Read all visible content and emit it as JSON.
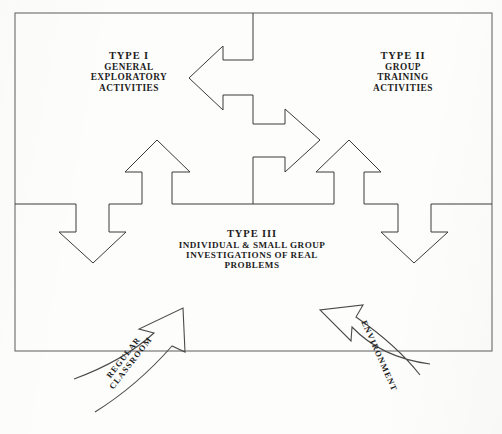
{
  "diagram": {
    "background_color": "#fdfdfc",
    "ink_color": "#3a3a3a",
    "frame_color": "#6b6b6b",
    "frame": {
      "name": "outer-rectangle",
      "x": 15,
      "y": 13,
      "width": 477,
      "height": 338
    },
    "blocks": [
      {
        "id": "type1",
        "heading": "TYPE I",
        "lines": [
          "GENERAL",
          "EXPLORATORY",
          "ACTIVITIES"
        ]
      },
      {
        "id": "type2",
        "heading": "TYPE II",
        "lines": [
          "GROUP",
          "TRAINING",
          "ACTIVITIES"
        ]
      },
      {
        "id": "type3",
        "heading": "TYPE III",
        "lines": [
          "INDIVIDUAL & SMALL GROUP",
          "INVESTIGATIONS OF REAL",
          "PROBLEMS"
        ]
      }
    ],
    "arrows": [
      {
        "id": "center-double-arrow",
        "icon": "double-headed-z-arrow",
        "points_to": [
          "type1",
          "type2"
        ],
        "description": "Z-shaped double-headed arrow linking Type I and Type II"
      },
      {
        "id": "up-arrow-left",
        "icon": "arrow-up-icon",
        "description": "Up arrow from Type III region toward Type I"
      },
      {
        "id": "up-arrow-right",
        "icon": "arrow-up-icon",
        "description": "Up arrow from Type III region toward Type II"
      },
      {
        "id": "down-arrow-left",
        "icon": "arrow-down-icon",
        "description": "Down arrow from Type I toward outer left boundary"
      },
      {
        "id": "down-arrow-right",
        "icon": "arrow-down-icon",
        "description": "Down arrow from Type II toward outer right boundary"
      },
      {
        "id": "curved-arrow-classroom",
        "icon": "curved-arrow-up-right-icon",
        "label": "REGULAR CLASSROOM",
        "label_lines": [
          "REGULAR",
          "CLASSROOM"
        ],
        "description": "Curved inbound arrow entering the model from the regular classroom"
      },
      {
        "id": "curved-arrow-environment",
        "icon": "curved-arrow-up-left-icon",
        "label": "ENVIRONMENT",
        "label_lines": [
          "ENVIRONMENT"
        ],
        "description": "Curved inbound arrow entering the model from the environment"
      }
    ]
  }
}
